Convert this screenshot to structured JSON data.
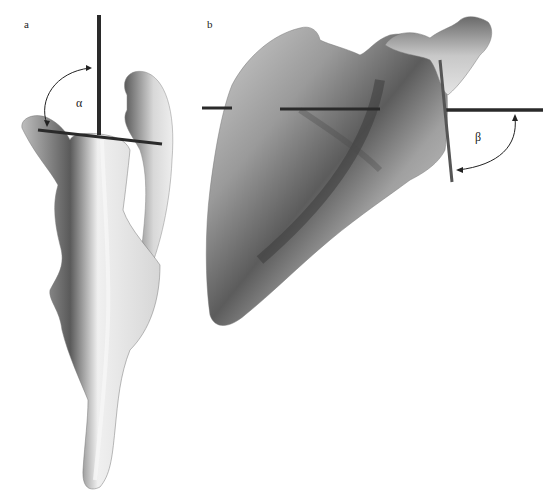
{
  "figure": {
    "panels": [
      {
        "id": "a",
        "label": "a",
        "angle_symbol": "α",
        "subject": "scapula-lateral-view",
        "rods": [
          "vertical-rod",
          "horizontal-rod"
        ]
      },
      {
        "id": "b",
        "label": "b",
        "angle_symbol": "β",
        "subject": "scapula-posterior-view",
        "rods": [
          "horizontal-rod",
          "vertical-rod"
        ]
      }
    ],
    "colors": {
      "background": "#ffffff",
      "rod": "#2a2a2a",
      "bone_light": "#e8e8e8",
      "bone_mid": "#a8a8a8",
      "bone_dark": "#4a4a4a",
      "arrow": "#222222"
    }
  }
}
